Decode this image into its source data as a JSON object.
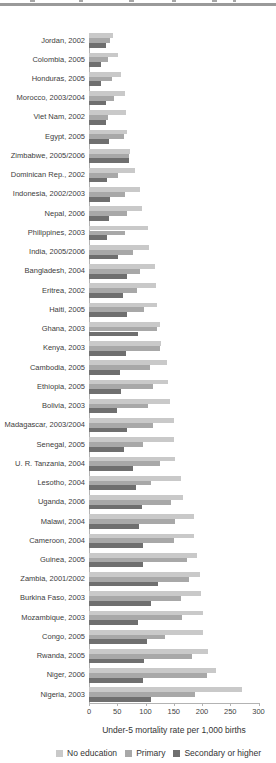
{
  "axis": {
    "xlabel": "Under-5 mortality rate per 1,000 births",
    "ticks": [
      "0",
      "50",
      "100",
      "150",
      "200",
      "250",
      "300"
    ]
  },
  "legend": [
    {
      "label": "No education",
      "color": "#c9c9c9"
    },
    {
      "label": "Primary",
      "color": "#a8a8a8"
    },
    {
      "label": "Secondary or higher",
      "color": "#6f6f6f"
    }
  ],
  "chart_data": {
    "type": "bar",
    "orientation": "horizontal",
    "xlabel": "Under-5 mortality rate per 1,000 births",
    "xlim": [
      0,
      300
    ],
    "xticks": [
      0,
      50,
      100,
      150,
      200,
      250,
      300
    ],
    "grid": false,
    "legend_position": "bottom",
    "series_colors": [
      "#c9c9c9",
      "#a8a8a8",
      "#6f6f6f"
    ],
    "categories": [
      "Jordan, 2002",
      "Colombia, 2005",
      "Honduras, 2005",
      "Morocco, 2003/2004",
      "Viet Nam, 2002",
      "Egypt, 2005",
      "Zimbabwe, 2005/2006",
      "Dominican Rep., 2002",
      "Indonesia, 2002/2003",
      "Nepal, 2006",
      "Philippines, 2003",
      "India, 2005/2006",
      "Bangladesh, 2004",
      "Eritrea, 2002",
      "Haiti, 2005",
      "Ghana, 2003",
      "Kenya, 2003",
      "Cambodia, 2005",
      "Ethiopia, 2005",
      "Bolivia, 2003",
      "Madagascar, 2003/2004",
      "Senegal, 2005",
      "U. R. Tanzania, 2004",
      "Lesotho, 2004",
      "Uganda, 2006",
      "Malawi, 2004",
      "Cameroon, 2004",
      "Guinea, 2005",
      "Zambia, 2001/2002",
      "Burkina Faso, 2003",
      "Mozambique, 2003",
      "Congo, 2005",
      "Rwanda, 2005",
      "Niger, 2006",
      "Nigeria, 2003"
    ],
    "series": [
      {
        "name": "No education",
        "values": [
          43,
          51,
          57,
          63,
          65,
          68,
          72,
          82,
          90,
          94,
          105,
          107,
          116,
          119,
          121,
          125,
          127,
          138,
          139,
          143,
          150,
          151,
          153,
          162,
          166,
          185,
          186,
          192,
          197,
          198,
          201,
          201,
          211,
          224,
          270
        ]
      },
      {
        "name": "Primary",
        "values": [
          37,
          33,
          41,
          44,
          33,
          62,
          71,
          52,
          64,
          67,
          64,
          78,
          90,
          85,
          97,
          120,
          126,
          108,
          113,
          105,
          113,
          96,
          126,
          109,
          145,
          153,
          150,
          173,
          177,
          162,
          164,
          135,
          183,
          209,
          187
        ]
      },
      {
        "name": "Secondary or higher",
        "values": [
          30,
          21,
          21,
          30,
          30,
          36,
          70,
          32,
          38,
          35,
          31,
          51,
          68,
          61,
          67,
          86,
          65,
          55,
          56,
          50,
          67,
          62,
          77,
          83,
          93,
          89,
          95,
          95,
          123,
          109,
          87,
          103,
          97,
          95,
          110
        ]
      }
    ]
  }
}
